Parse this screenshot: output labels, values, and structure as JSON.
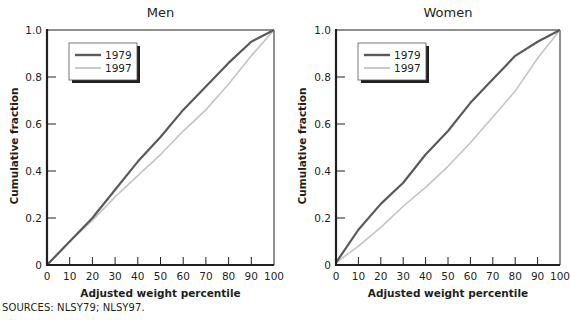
{
  "sources": "SOURCES: NLSY79; NLSY97.",
  "colors": {
    "series_1979": "#5a5a5a",
    "series_1997": "#c4c4c4",
    "axis": "#231f20"
  },
  "chart_data": [
    {
      "type": "line",
      "title": "Men",
      "xlabel": "Adjusted weight percentile",
      "ylabel": "Cumulative fraction",
      "xlim": [
        0,
        100
      ],
      "ylim": [
        0,
        1.0
      ],
      "xticks": [
        "0",
        "10",
        "20",
        "30",
        "40",
        "50",
        "60",
        "70",
        "80",
        "90",
        "100"
      ],
      "yticks": [
        "0",
        "0.2",
        "0.4",
        "0.6",
        "0.8",
        "1.0"
      ],
      "legend": [
        "1979",
        "1997"
      ],
      "legend_position": "upper left",
      "grid": false,
      "x": [
        0,
        10,
        20,
        30,
        40,
        50,
        60,
        70,
        80,
        90,
        100
      ],
      "series": [
        {
          "name": "1979",
          "values": [
            0.0,
            0.1,
            0.2,
            0.32,
            0.44,
            0.545,
            0.66,
            0.76,
            0.86,
            0.95,
            1.0
          ]
        },
        {
          "name": "1997",
          "values": [
            0.0,
            0.1,
            0.19,
            0.29,
            0.38,
            0.47,
            0.57,
            0.66,
            0.77,
            0.89,
            1.0
          ]
        }
      ]
    },
    {
      "type": "line",
      "title": "Women",
      "xlabel": "Adjusted weight percentile",
      "ylabel": "Cumulative fraction",
      "xlim": [
        0,
        100
      ],
      "ylim": [
        0,
        1.0
      ],
      "xticks": [
        "0",
        "10",
        "20",
        "30",
        "40",
        "50",
        "60",
        "70",
        "80",
        "90",
        "100"
      ],
      "yticks": [
        "0",
        "0.2",
        "0.4",
        "0.6",
        "0.8",
        "1.0"
      ],
      "legend": [
        "1979",
        "1997"
      ],
      "legend_position": "upper left",
      "grid": false,
      "x": [
        0,
        10,
        20,
        30,
        40,
        50,
        60,
        70,
        80,
        90,
        100
      ],
      "series": [
        {
          "name": "1979",
          "values": [
            0.01,
            0.15,
            0.26,
            0.35,
            0.47,
            0.57,
            0.69,
            0.79,
            0.89,
            0.95,
            1.0
          ]
        },
        {
          "name": "1997",
          "values": [
            0.01,
            0.08,
            0.16,
            0.25,
            0.33,
            0.42,
            0.52,
            0.63,
            0.74,
            0.88,
            1.0
          ]
        }
      ]
    }
  ]
}
